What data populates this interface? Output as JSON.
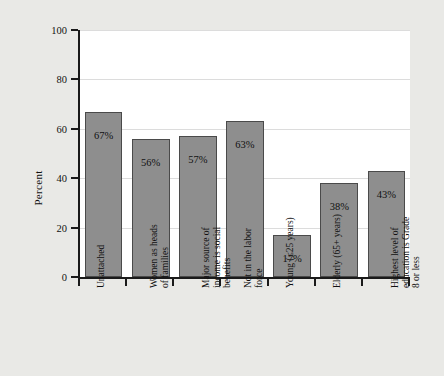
{
  "chart_data": {
    "type": "bar",
    "title": "",
    "subtitle": "",
    "xlabel": "",
    "ylabel": "Percent",
    "ylim": [
      0,
      100
    ],
    "grid": true,
    "legend": false,
    "categories": [
      "Unattached",
      "Women as heads\nof families",
      "Major source of\nincome is social\nbenefits",
      "Not in the labor\nforce",
      "Young (≤25 years)",
      "Elderly (65+ years)",
      "Highest level of\neducation is Grade\n8 or less"
    ],
    "values": [
      67,
      56,
      57,
      63,
      17,
      38,
      43
    ],
    "value_labels": [
      "67%",
      "56%",
      "57%",
      "63%",
      "17%",
      "38%",
      "43%"
    ],
    "ytick_labels": [
      "0",
      "20",
      "40",
      "60",
      "80",
      "100"
    ],
    "ytick_values": [
      0,
      20,
      40,
      60,
      80,
      100
    ],
    "bar_color": "#8e8e8e",
    "bar_edge_color": "#4a4a4a",
    "plot_background": "#ffffff",
    "page_background": "#e9e9e6",
    "axis_color": "#1a1a1a",
    "text_color": "#111111"
  }
}
